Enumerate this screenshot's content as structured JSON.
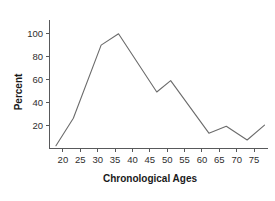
{
  "chart_data": {
    "type": "line",
    "title": "",
    "subtitle": "",
    "xlabel": "Chronological Ages",
    "ylabel": "Percent",
    "xlim": [
      16,
      79
    ],
    "ylim": [
      0,
      112
    ],
    "grid": false,
    "legend": null,
    "line_color": "#6b6b6b",
    "axis_color": "#58595b",
    "x_ticks": [
      20,
      25,
      30,
      35,
      40,
      45,
      50,
      55,
      60,
      65,
      70,
      75
    ],
    "x_tick_labels": [
      "20",
      "25",
      "30",
      "35",
      "40",
      "45",
      "50",
      "55",
      "60",
      "65",
      "70",
      "75"
    ],
    "y_ticks": [
      20,
      40,
      60,
      80,
      100
    ],
    "y_tick_labels": [
      "20",
      "40",
      "60",
      "80",
      "100"
    ],
    "x": [
      18,
      23,
      31,
      36,
      47,
      51,
      62,
      67,
      73,
      78
    ],
    "values": [
      2,
      26,
      90,
      100,
      49,
      59,
      13,
      19,
      7,
      20
    ],
    "points": [
      {
        "age": 18,
        "percent": 2
      },
      {
        "age": 23,
        "percent": 26
      },
      {
        "age": 31,
        "percent": 90
      },
      {
        "age": 36,
        "percent": 100
      },
      {
        "age": 47,
        "percent": 49
      },
      {
        "age": 51,
        "percent": 59
      },
      {
        "age": 62,
        "percent": 13
      },
      {
        "age": 67,
        "percent": 19
      },
      {
        "age": 73,
        "percent": 7
      },
      {
        "age": 78,
        "percent": 20
      }
    ]
  }
}
